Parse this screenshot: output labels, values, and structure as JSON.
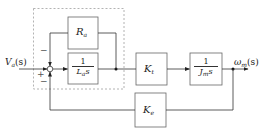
{
  "diagram": {
    "type": "block-diagram",
    "input": {
      "symbol": "V",
      "subscript": "a",
      "arg": "(s)"
    },
    "output": {
      "symbol": "ω",
      "subscript": "m",
      "arg": "(s)"
    },
    "summing_junction": {
      "signs": {
        "input": "+",
        "top": "−",
        "bottom": "−"
      }
    },
    "blocks": [
      {
        "id": "Ra",
        "symbol": "R",
        "subscript": "a",
        "kind": "gain"
      },
      {
        "id": "armature",
        "numerator": "1",
        "denominator_symbol": "L",
        "denominator_subscript": "a",
        "denominator_var": "s",
        "kind": "transfer"
      },
      {
        "id": "Kt",
        "symbol": "K",
        "subscript": "t",
        "kind": "gain"
      },
      {
        "id": "mech",
        "numerator": "1",
        "denominator_symbol": "J",
        "denominator_subscript": "m",
        "denominator_var": "s",
        "kind": "transfer"
      },
      {
        "id": "Ke",
        "symbol": "K",
        "subscript": "e",
        "kind": "gain"
      }
    ],
    "colors": {
      "line": "#333333",
      "dashed": "#9a9a9a",
      "box": "#555555"
    }
  }
}
